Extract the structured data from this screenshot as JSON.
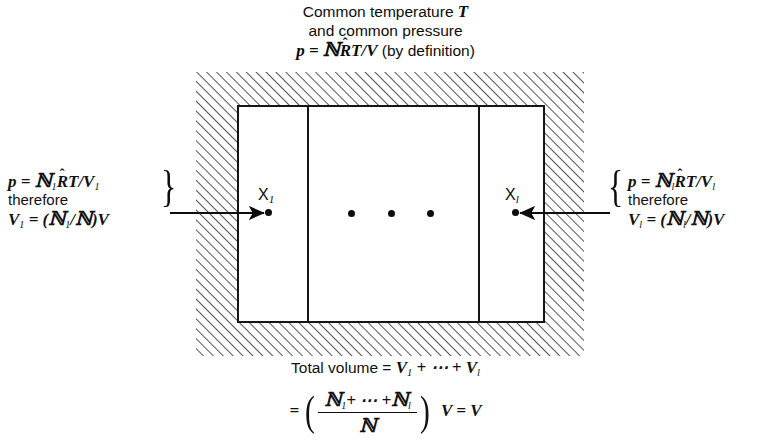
{
  "figure": {
    "header": {
      "line1_text": "Common temperature ",
      "line1_symbol": "T",
      "line2": "and common pressure",
      "line3_lhs": "p",
      "line3_eq": " = ",
      "line3_script_n": "ℕ",
      "line3_rbar": "R",
      "line3_hat": "ˆ",
      "line3_tv": "T/V",
      "line3_note": " (by definition)"
    },
    "left_annotation": {
      "line1_p": "p",
      "line1_eq": " = ",
      "line1_script_n": "ℕ",
      "line1_sub": "1",
      "line1_rbar": "R",
      "line1_hat": "ˆ",
      "line1_tv": "T/V",
      "line1_tv_sub": "1",
      "line2": "therefore",
      "line3_v": "V",
      "line3_v_sub": "1",
      "line3_eq": " = (",
      "line3_n1": "ℕ",
      "line3_n1_sub": "1",
      "line3_slash": "/",
      "line3_n": "ℕ",
      "line3_close": ")V",
      "brace": "}"
    },
    "right_annotation": {
      "line1_p": "p",
      "line1_eq": " = ",
      "line1_script_n": "ℕ",
      "line1_sub": "l",
      "line1_rbar": "R",
      "line1_hat": "ˆ",
      "line1_tv": "T/V",
      "line1_tv_sub": "l",
      "line2": "therefore",
      "line3_v": "V",
      "line3_v_sub": "l",
      "line3_eq": " = (",
      "line3_n1": "ℕ",
      "line3_n1_sub": "l",
      "line3_slash": "/",
      "line3_n": "ℕ",
      "line3_close": ")V",
      "brace": "{"
    },
    "cells": {
      "left_label_main": "X",
      "left_label_sub": "1",
      "right_label_main": "X",
      "right_label_sub": "l",
      "ellipsis_dot_count": 3
    },
    "bottom": {
      "line1_text": "Total volume = ",
      "line1_v1": "V",
      "line1_v1_sub": "1",
      "line1_plus": " + ",
      "line1_cdots": "⋯",
      "line1_plus2": " + ",
      "line1_vl": "V",
      "line1_vl_sub": "l",
      "line2_eq": "= ",
      "line2_paren_open": "(",
      "line2_num_n1": "ℕ",
      "line2_num_n1_sub": "1",
      "line2_num_plus": "+ ",
      "line2_num_cdots": "⋯",
      "line2_num_plus2": " +",
      "line2_num_nl": "ℕ",
      "line2_num_nl_sub": "l",
      "line2_den_n": "ℕ",
      "line2_paren_close": ")",
      "line2_tail_v": "V",
      "line2_tail_eq": " = ",
      "line2_tail_v2": "V"
    },
    "style": {
      "ink_color": "#0d0d0d",
      "line_color": "#151515",
      "hatch_color": "#2a2a2a",
      "background": "#ffffff"
    }
  }
}
